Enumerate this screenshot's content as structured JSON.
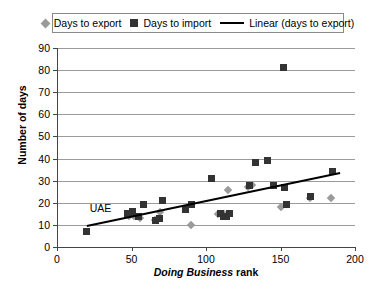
{
  "chart_data": {
    "type": "scatter",
    "title": "",
    "xlabel_italic": "Doing Business",
    "xlabel_rest": " rank",
    "xlabel": "Doing Business rank",
    "ylabel": "Number of days",
    "xlim": [
      0,
      200
    ],
    "ylim": [
      0,
      90
    ],
    "xticks": [
      0,
      50,
      100,
      150,
      200
    ],
    "yticks": [
      0,
      10,
      20,
      30,
      40,
      50,
      60,
      70,
      80,
      90
    ],
    "grid": "horizontal",
    "legend_position": "top-center",
    "legend": [
      {
        "label": "Days to export",
        "marker": "diamond",
        "color": "#9a9a9a"
      },
      {
        "label": "Days to import",
        "marker": "square",
        "color": "#333333"
      },
      {
        "label": "Linear (days to export)",
        "marker": "line",
        "color": "#000000"
      }
    ],
    "annotations": [
      {
        "text": "UAE",
        "x": 22,
        "y": 17
      }
    ],
    "series": [
      {
        "name": "Days to export",
        "marker": "diamond",
        "color": "#9a9a9a",
        "points": [
          {
            "x": 48,
            "y": 14
          },
          {
            "x": 52,
            "y": 14
          },
          {
            "x": 56,
            "y": 13
          },
          {
            "x": 66,
            "y": 12
          },
          {
            "x": 69,
            "y": 16
          },
          {
            "x": 90,
            "y": 10
          },
          {
            "x": 108,
            "y": 15
          },
          {
            "x": 112,
            "y": 15
          },
          {
            "x": 115,
            "y": 26
          },
          {
            "x": 128,
            "y": 27
          },
          {
            "x": 131,
            "y": 28
          },
          {
            "x": 150,
            "y": 18
          },
          {
            "x": 170,
            "y": 22
          },
          {
            "x": 184,
            "y": 22
          }
        ]
      },
      {
        "name": "Days to import",
        "marker": "square",
        "color": "#333333",
        "points": [
          {
            "x": 20,
            "y": 7
          },
          {
            "x": 47,
            "y": 15
          },
          {
            "x": 49,
            "y": 15
          },
          {
            "x": 51,
            "y": 16
          },
          {
            "x": 55,
            "y": 14
          },
          {
            "x": 58,
            "y": 19
          },
          {
            "x": 66,
            "y": 12
          },
          {
            "x": 69,
            "y": 13
          },
          {
            "x": 71,
            "y": 21
          },
          {
            "x": 86,
            "y": 17
          },
          {
            "x": 90,
            "y": 19
          },
          {
            "x": 104,
            "y": 31
          },
          {
            "x": 110,
            "y": 15
          },
          {
            "x": 112,
            "y": 14
          },
          {
            "x": 114,
            "y": 14
          },
          {
            "x": 116,
            "y": 15
          },
          {
            "x": 129,
            "y": 28
          },
          {
            "x": 133,
            "y": 38
          },
          {
            "x": 141,
            "y": 39
          },
          {
            "x": 145,
            "y": 28
          },
          {
            "x": 152,
            "y": 81
          },
          {
            "x": 153,
            "y": 27
          },
          {
            "x": 154,
            "y": 19
          },
          {
            "x": 170,
            "y": 23
          },
          {
            "x": 185,
            "y": 34
          }
        ]
      }
    ],
    "trendline": {
      "name": "Linear (days to export)",
      "color": "#000000",
      "x0": 20,
      "y0": 9.5,
      "x1": 190,
      "y1": 33.5
    }
  }
}
